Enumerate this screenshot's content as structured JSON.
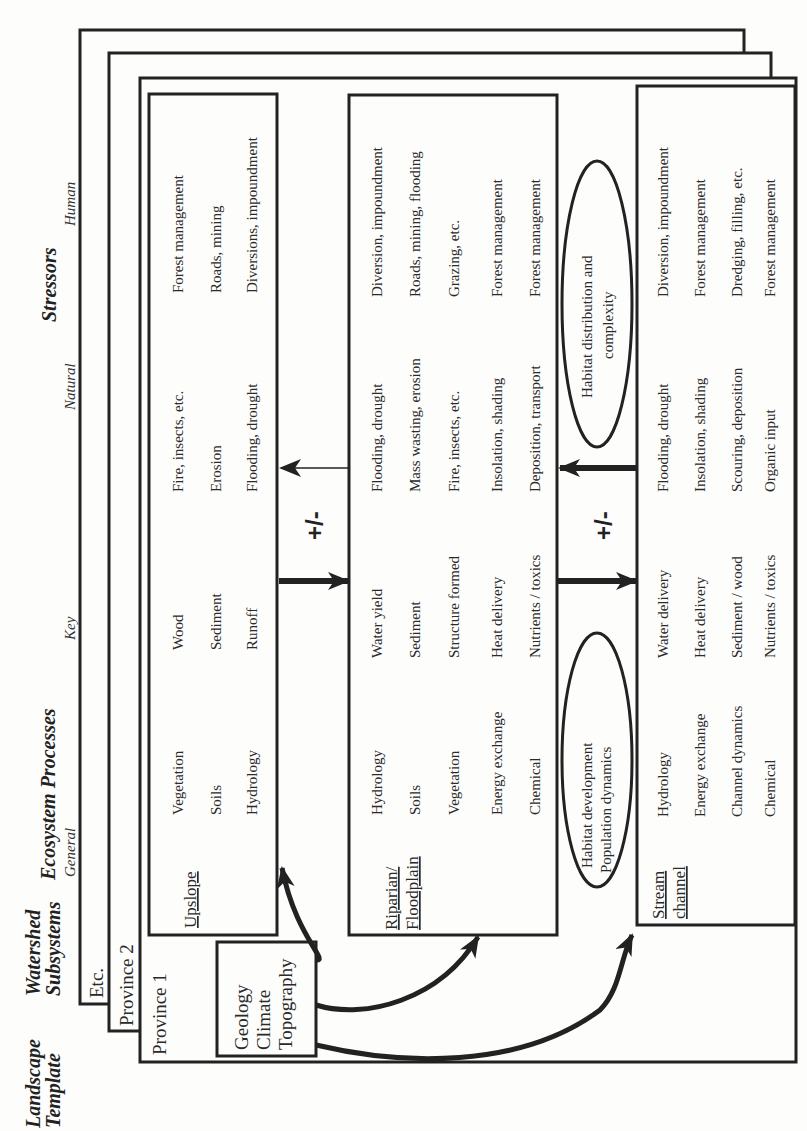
{
  "headers": {
    "landscape_template": [
      "Landscape",
      "Template"
    ],
    "watershed_subsystems": [
      "Watershed",
      "Subsystems"
    ],
    "ecosystem_processes": "Ecosystem Processes",
    "general": "General",
    "key": "Key",
    "stressors": "Stressors",
    "natural": "Natural",
    "human": "Human"
  },
  "provinces": [
    "Etc.",
    "Province 2",
    "Province 1"
  ],
  "template_box": [
    "Geology",
    "Climate",
    "Topography"
  ],
  "subsystems": [
    {
      "title": [
        "Upslope"
      ],
      "rows": [
        {
          "general": "Vegetation",
          "key": "Wood",
          "natural": "Fire, insects, etc.",
          "human": "Forest management"
        },
        {
          "general": "Soils",
          "key": "Sediment",
          "natural": "Erosion",
          "human": "Roads, mining"
        },
        {
          "general": "Hydrology",
          "key": "Runoff",
          "natural": "Flooding, drought",
          "human": "Diversions, impoundment"
        }
      ]
    },
    {
      "title": [
        "Riparian/",
        "Floodplain"
      ],
      "rows": [
        {
          "general": "Hydrology",
          "key": "Water yield",
          "natural": "Flooding,  drought",
          "human": "Diversion, impoundment"
        },
        {
          "general": "Soils",
          "key": "Sediment",
          "natural": "Mass wasting, erosion",
          "human": "Roads, mining, flooding"
        },
        {
          "general": "Vegetation",
          "key": "Structure formed",
          "natural": "Fire, insects, etc.",
          "human": "Grazing, etc."
        },
        {
          "general": "Energy exchange",
          "key": "Heat delivery",
          "natural": "Insolation, shading",
          "human": "Forest management"
        },
        {
          "general": "Chemical",
          "key": "Nutrients / toxics",
          "natural": "Deposition, transport",
          "human": "Forest management"
        }
      ]
    },
    {
      "title": [
        "Stream",
        "channel"
      ],
      "rows": [
        {
          "general": "Hydrology",
          "key": "Water delivery",
          "natural": "Flooding, drought",
          "human": "Diversion, impoundment"
        },
        {
          "general": "Energy exchange",
          "key": "Heat delivery",
          "natural": "Insolation, shading",
          "human": "Forest management"
        },
        {
          "general": "Channel dynamics",
          "key": "Sediment / wood",
          "natural": "Scouring, deposition",
          "human": "Dredging, filling, etc."
        },
        {
          "general": "Chemical",
          "key": "Nutrients / toxics",
          "natural": "Organic input",
          "human": "Forest management"
        }
      ]
    }
  ],
  "feedback_labels": [
    "+/-",
    "+/-"
  ],
  "ellipses": {
    "habitat_development": [
      "Habitat development",
      "Population dynamics"
    ],
    "habitat_distribution": [
      "Habitat distribution and",
      "complexity"
    ]
  }
}
